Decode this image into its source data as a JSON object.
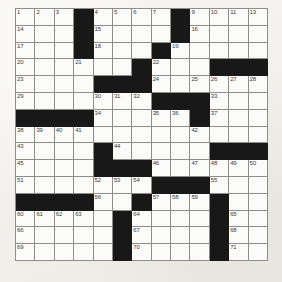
{
  "puzzle": {
    "kind": "crossword-grid",
    "rows": 13,
    "cols": 13,
    "colors": {
      "page_background": "#f4f3ef",
      "cell_background": "#fbfbf9",
      "block_color": "#181818",
      "grid_line": "#8e8d89",
      "number_color": "#3a3a38"
    },
    "blocks": [
      [
        0,
        3
      ],
      [
        0,
        8
      ],
      [
        1,
        3
      ],
      [
        1,
        8
      ],
      [
        2,
        3
      ],
      [
        2,
        7
      ],
      [
        3,
        6
      ],
      [
        3,
        10
      ],
      [
        3,
        11
      ],
      [
        3,
        12
      ],
      [
        4,
        4
      ],
      [
        4,
        5
      ],
      [
        4,
        6
      ],
      [
        5,
        7
      ],
      [
        5,
        8
      ],
      [
        5,
        9
      ],
      [
        6,
        0
      ],
      [
        6,
        1
      ],
      [
        6,
        2
      ],
      [
        6,
        3
      ],
      [
        6,
        9
      ],
      [
        8,
        4
      ],
      [
        8,
        10
      ],
      [
        8,
        11
      ],
      [
        8,
        12
      ],
      [
        9,
        4
      ],
      [
        9,
        5
      ],
      [
        9,
        6
      ],
      [
        10,
        7
      ],
      [
        10,
        8
      ],
      [
        10,
        9
      ],
      [
        11,
        0
      ],
      [
        11,
        1
      ],
      [
        11,
        2
      ],
      [
        11,
        3
      ],
      [
        11,
        6
      ],
      [
        11,
        10
      ],
      [
        12,
        5
      ],
      [
        12,
        10
      ]
    ],
    "numbers": [
      {
        "r": 0,
        "c": 0,
        "n": "1"
      },
      {
        "r": 0,
        "c": 1,
        "n": "2"
      },
      {
        "r": 0,
        "c": 2,
        "n": "3"
      },
      {
        "r": 0,
        "c": 4,
        "n": "4"
      },
      {
        "r": 0,
        "c": 5,
        "n": "5"
      },
      {
        "r": 0,
        "c": 6,
        "n": "6"
      },
      {
        "r": 0,
        "c": 7,
        "n": "7"
      },
      {
        "r": 0,
        "c": 9,
        "n": "9"
      },
      {
        "r": 0,
        "c": 10,
        "n": "10"
      },
      {
        "r": 0,
        "c": 11,
        "n": "11"
      },
      {
        "r": 0,
        "c": 12,
        "n": "13"
      },
      {
        "r": 1,
        "c": 0,
        "n": "14"
      },
      {
        "r": 1,
        "c": 4,
        "n": "15"
      },
      {
        "r": 1,
        "c": 9,
        "n": "16"
      },
      {
        "r": 2,
        "c": 0,
        "n": "17"
      },
      {
        "r": 2,
        "c": 4,
        "n": "18"
      },
      {
        "r": 2,
        "c": 8,
        "n": "19"
      },
      {
        "r": 3,
        "c": 0,
        "n": "20"
      },
      {
        "r": 3,
        "c": 3,
        "n": "21"
      },
      {
        "r": 3,
        "c": 7,
        "n": "22"
      },
      {
        "r": 4,
        "c": 0,
        "n": "23"
      },
      {
        "r": 4,
        "c": 7,
        "n": "24"
      },
      {
        "r": 4,
        "c": 9,
        "n": "25"
      },
      {
        "r": 4,
        "c": 10,
        "n": "26"
      },
      {
        "r": 4,
        "c": 11,
        "n": "27"
      },
      {
        "r": 4,
        "c": 12,
        "n": "28"
      },
      {
        "r": 5,
        "c": 0,
        "n": "29"
      },
      {
        "r": 5,
        "c": 4,
        "n": "30"
      },
      {
        "r": 5,
        "c": 5,
        "n": "31"
      },
      {
        "r": 5,
        "c": 6,
        "n": "32"
      },
      {
        "r": 5,
        "c": 10,
        "n": "33"
      },
      {
        "r": 6,
        "c": 4,
        "n": "34"
      },
      {
        "r": 6,
        "c": 7,
        "n": "35"
      },
      {
        "r": 6,
        "c": 8,
        "n": "36"
      },
      {
        "r": 6,
        "c": 10,
        "n": "37"
      },
      {
        "r": 7,
        "c": 0,
        "n": "38"
      },
      {
        "r": 7,
        "c": 1,
        "n": "39"
      },
      {
        "r": 7,
        "c": 2,
        "n": "40"
      },
      {
        "r": 7,
        "c": 3,
        "n": "41"
      },
      {
        "r": 7,
        "c": 9,
        "n": "42"
      },
      {
        "r": 8,
        "c": 0,
        "n": "43"
      },
      {
        "r": 8,
        "c": 5,
        "n": "44"
      },
      {
        "r": 9,
        "c": 0,
        "n": "45"
      },
      {
        "r": 9,
        "c": 7,
        "n": "46"
      },
      {
        "r": 9,
        "c": 9,
        "n": "47"
      },
      {
        "r": 9,
        "c": 10,
        "n": "48"
      },
      {
        "r": 9,
        "c": 11,
        "n": "49"
      },
      {
        "r": 9,
        "c": 12,
        "n": "50"
      },
      {
        "r": 10,
        "c": 0,
        "n": "51"
      },
      {
        "r": 10,
        "c": 4,
        "n": "52"
      },
      {
        "r": 10,
        "c": 5,
        "n": "53"
      },
      {
        "r": 10,
        "c": 6,
        "n": "54"
      },
      {
        "r": 10,
        "c": 10,
        "n": "55"
      },
      {
        "r": 11,
        "c": 4,
        "n": "56"
      },
      {
        "r": 11,
        "c": 7,
        "n": "57"
      },
      {
        "r": 11,
        "c": 8,
        "n": "58"
      },
      {
        "r": 11,
        "c": 9,
        "n": "59"
      },
      {
        "r": 12,
        "c": 0,
        "n": "60"
      },
      {
        "r": 12,
        "c": 1,
        "n": "61"
      },
      {
        "r": 12,
        "c": 2,
        "n": "62"
      },
      {
        "r": 12,
        "c": 3,
        "n": "63"
      },
      {
        "r": 12,
        "c": 6,
        "n": "64"
      },
      {
        "r": 12,
        "c": 11,
        "n": "65"
      }
    ],
    "extra_rows": {
      "note": "grid continues below visible 13 rows",
      "numbers_row13": [
        {
          "c": 0,
          "n": "66"
        },
        {
          "c": 11,
          "n": "68"
        },
        {
          "c": 6,
          "n": "67"
        }
      ],
      "numbers_row14": [
        {
          "c": 0,
          "n": "69"
        },
        {
          "c": 6,
          "n": "70"
        },
        {
          "c": 11,
          "n": "71"
        }
      ]
    }
  }
}
